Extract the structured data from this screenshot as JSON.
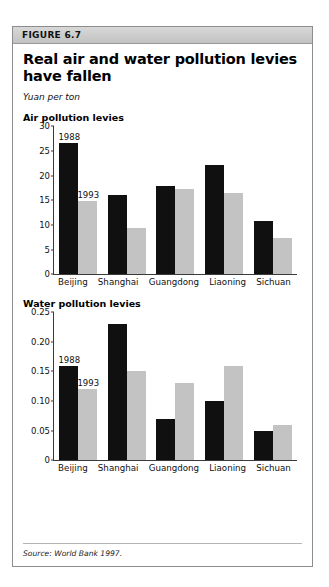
{
  "figure": {
    "header_label": "FIGURE 6.7",
    "title": "Real air and water pollution levies have fallen",
    "units": "Yuan per ton",
    "source": "Source: World Bank 1997."
  },
  "legend": {
    "series_1_label": "1988",
    "series_2_label": "1993"
  },
  "colors": {
    "series_1": "#101010",
    "series_2": "#c3c3c3",
    "header_bg": "#cccccc",
    "frame_border": "#8d8d8d",
    "axis": "#3a3a3a"
  },
  "chart_data": [
    {
      "type": "bar",
      "title": "Air pollution levies",
      "xlabel": "",
      "ylabel": "",
      "ylim": [
        0,
        30
      ],
      "yticks": [
        0,
        5,
        10,
        15,
        20,
        25,
        30
      ],
      "ytick_labels": [
        "0",
        "5",
        "10",
        "15",
        "20",
        "25",
        "30"
      ],
      "grid": false,
      "legend_position": "inline-annotation",
      "categories": [
        "Beijing",
        "Shanghai",
        "Guangdong",
        "Liaoning",
        "Sichuan"
      ],
      "series": [
        {
          "name": "1988",
          "values": [
            26.7,
            16.0,
            17.8,
            22.2,
            10.7
          ]
        },
        {
          "name": "1993",
          "values": [
            14.8,
            9.3,
            17.2,
            16.4,
            7.3
          ]
        }
      ],
      "annotations": [
        {
          "text": "1988",
          "series": "1988",
          "category": "Beijing"
        },
        {
          "text": "1993",
          "series": "1993",
          "category": "Beijing"
        }
      ]
    },
    {
      "type": "bar",
      "title": "Water pollution levies",
      "xlabel": "",
      "ylabel": "",
      "ylim": [
        0,
        0.25
      ],
      "yticks": [
        0,
        0.05,
        0.1,
        0.15,
        0.2,
        0.25
      ],
      "ytick_labels": [
        "0",
        "0.05",
        "0.10",
        "0.15",
        "0.20",
        "0.25"
      ],
      "grid": false,
      "legend_position": "inline-annotation",
      "categories": [
        "Beijing",
        "Shanghai",
        "Guangdong",
        "Liaoning",
        "Sichuan"
      ],
      "series": [
        {
          "name": "1988",
          "values": [
            0.16,
            0.23,
            0.07,
            0.1,
            0.05
          ]
        },
        {
          "name": "1993",
          "values": [
            0.12,
            0.15,
            0.13,
            0.16,
            0.06
          ]
        }
      ],
      "annotations": [
        {
          "text": "1988",
          "series": "1988",
          "category": "Beijing"
        },
        {
          "text": "1993",
          "series": "1993",
          "category": "Beijing"
        }
      ]
    }
  ]
}
